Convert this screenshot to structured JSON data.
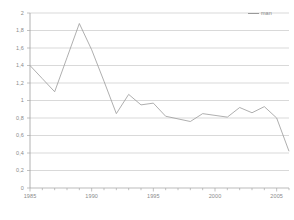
{
  "chart_data": {
    "type": "line",
    "title": "",
    "subtitle": "",
    "xlabel": "",
    "ylabel": "",
    "xlim": [
      1985,
      2006
    ],
    "ylim": [
      0,
      2
    ],
    "grid": true,
    "legend_position": "top-right",
    "y_ticks": [
      "0",
      "0,2",
      "0,4",
      "0,6",
      "0,8",
      "1",
      "1,2",
      "1,4",
      "1,6",
      "1,8",
      "2"
    ],
    "y_tick_values": [
      0,
      0.2,
      0.4,
      0.6,
      0.8,
      1.0,
      1.2,
      1.4,
      1.6,
      1.8,
      2.0
    ],
    "x_ticks": [
      "1985",
      "1990",
      "1995",
      "2000",
      "2005"
    ],
    "x_tick_values": [
      1985,
      1990,
      1995,
      2000,
      2005
    ],
    "x_minor_tick_step": 1,
    "series": [
      {
        "name": "man",
        "color": "#9a9a9a",
        "x": [
          1985,
          1986,
          1987,
          1988,
          1989,
          1990,
          1991,
          1992,
          1993,
          1994,
          1995,
          1996,
          1997,
          1998,
          1999,
          2000,
          2001,
          2002,
          2003,
          2004,
          2005,
          2006
        ],
        "values": [
          1.4,
          1.25,
          1.1,
          1.49,
          1.88,
          1.58,
          1.22,
          0.85,
          1.07,
          0.95,
          0.97,
          0.82,
          0.79,
          0.76,
          0.85,
          0.83,
          0.81,
          0.92,
          0.86,
          0.93,
          0.8,
          0.42
        ]
      }
    ]
  },
  "legend": {
    "entries": [
      {
        "label": "man",
        "color": "#9a9a9a"
      }
    ]
  },
  "axes": {
    "y_axis_name": "value-axis",
    "x_axis_name": "year-axis"
  }
}
